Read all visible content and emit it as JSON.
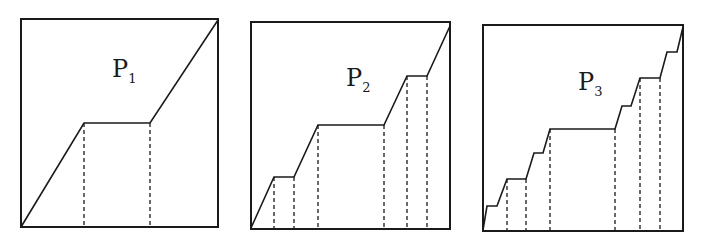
{
  "figure": {
    "width": 705,
    "height": 244,
    "stroke_color": "#1a1a1a",
    "background": "#ffffff"
  },
  "panels": [
    {
      "id": "P1",
      "label_main": "P",
      "label_sub": "1",
      "label_pos": [
        112,
        77
      ],
      "frame": {
        "x": 21,
        "y": 19,
        "w": 197,
        "h": 208
      },
      "curve": [
        [
          21,
          227
        ],
        [
          84,
          123
        ],
        [
          150,
          123
        ],
        [
          218,
          20
        ]
      ],
      "dashed_x": [
        84,
        150
      ],
      "plateau_count": 1
    },
    {
      "id": "P2",
      "label_main": "P",
      "label_sub": "2",
      "label_pos": [
        346,
        86
      ],
      "frame": {
        "x": 251,
        "y": 22,
        "w": 199,
        "h": 207
      },
      "curve": [
        [
          251,
          228
        ],
        [
          274,
          177
        ],
        [
          294,
          177
        ],
        [
          318,
          125
        ],
        [
          384,
          125
        ],
        [
          407,
          76
        ],
        [
          427,
          76
        ],
        [
          450,
          26
        ]
      ],
      "dashed_x": [
        274,
        294,
        318,
        384,
        407,
        427
      ],
      "plateau_count": 3
    },
    {
      "id": "P3",
      "label_main": "P",
      "label_sub": "3",
      "label_pos": [
        578,
        90
      ],
      "frame": {
        "x": 483,
        "y": 25,
        "w": 200,
        "h": 206
      },
      "curve": [
        [
          483,
          230
        ],
        [
          487,
          206
        ],
        [
          497,
          206
        ],
        [
          507,
          179
        ],
        [
          526,
          179
        ],
        [
          534,
          153
        ],
        [
          543,
          153
        ],
        [
          550,
          129
        ],
        [
          615,
          129
        ],
        [
          622,
          106
        ],
        [
          631,
          106
        ],
        [
          640,
          78
        ],
        [
          660,
          78
        ],
        [
          667,
          52
        ],
        [
          677,
          52
        ],
        [
          683,
          27
        ]
      ],
      "dashed_x": [
        507,
        526,
        550,
        615,
        640,
        660
      ],
      "plateau_count": 7
    }
  ]
}
